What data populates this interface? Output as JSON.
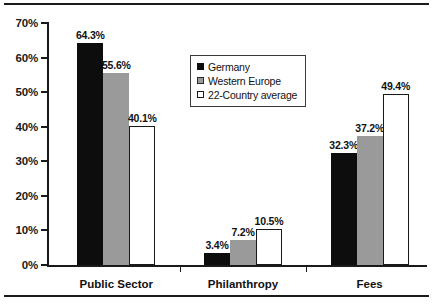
{
  "chart_data": {
    "type": "bar",
    "title": "",
    "subtitle": "",
    "xlabel": "",
    "ylabel": "",
    "categories": [
      "Public Sector",
      "Philanthropy",
      "Fees"
    ],
    "series": [
      {
        "name": "Germany",
        "color": "#0d0d0d",
        "swatch": "filled-black",
        "values": [
          64.3,
          55.6,
          32.3
        ]
      },
      {
        "name": "Western Europe",
        "color": "#9a9a9a",
        "swatch": "filled-gray",
        "values": [
          55.6,
          7.2,
          37.2
        ]
      },
      {
        "name": "22-Country average",
        "color": "#ffffff",
        "swatch": "outlined-white",
        "values": [
          40.1,
          10.5,
          49.4
        ]
      }
    ],
    "groups": [
      {
        "category": "Public Sector",
        "bars": [
          {
            "series": "Germany",
            "value": 64.3,
            "label": "64.3%"
          },
          {
            "series": "Western Europe",
            "value": 55.6,
            "label": "55.6%"
          },
          {
            "series": "22-Country average",
            "value": 40.1,
            "label": "40.1%"
          }
        ]
      },
      {
        "category": "Philanthropy",
        "bars": [
          {
            "series": "Germany",
            "value": 3.4,
            "label": "3.4%"
          },
          {
            "series": "Western Europe",
            "value": 7.2,
            "label": "7.2%"
          },
          {
            "series": "22-Country average",
            "value": 10.5,
            "label": "10.5%"
          }
        ]
      },
      {
        "category": "Fees",
        "bars": [
          {
            "series": "Germany",
            "value": 32.3,
            "label": "32.3%"
          },
          {
            "series": "Western Europe",
            "value": 37.2,
            "label": "37.2%"
          },
          {
            "series": "22-Country average",
            "value": 49.4,
            "label": "49.4%"
          }
        ]
      }
    ],
    "ylim": [
      0,
      70
    ],
    "ytick_values": [
      0,
      10,
      20,
      30,
      40,
      50,
      60,
      70
    ],
    "ytick_labels": [
      "0%",
      "10%",
      "20%",
      "30%",
      "40%",
      "50%",
      "60%",
      "70%"
    ],
    "grid": false,
    "legend_position": "upper-center-right",
    "legend_entries": [
      "Germany",
      "Western Europe",
      "22-Country average"
    ]
  },
  "decorations": {
    "rule_top": "horizontal-rule",
    "rule_bottom": "horizontal-rule"
  }
}
